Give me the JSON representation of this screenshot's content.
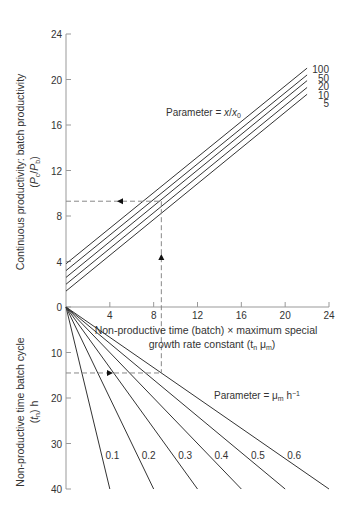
{
  "chart_data": [
    {
      "type": "line",
      "panel": "upper",
      "title": "",
      "xlabel": "Non-productive time (batch) × maximum special growth rate constant (tn μm)",
      "ylabel": "Continuous productivity: batch productivity (Pc/Pb)",
      "xlim": [
        0,
        24
      ],
      "ylim": [
        0,
        24
      ],
      "xticks": [
        4,
        8,
        12,
        16,
        20,
        24
      ],
      "yticks": [
        0,
        4,
        8,
        12,
        16,
        20,
        24
      ],
      "grid": false,
      "annotation": "Parameter = x/x0",
      "x": [
        0,
        22
      ],
      "series": [
        {
          "name": "100",
          "values": [
            3.8,
            21.0
          ]
        },
        {
          "name": "50",
          "values": [
            3.2,
            20.4
          ]
        },
        {
          "name": "20",
          "values": [
            2.6,
            19.9
          ]
        },
        {
          "name": "10",
          "values": [
            2.0,
            19.3
          ]
        },
        {
          "name": "5",
          "values": [
            1.4,
            18.7
          ]
        }
      ]
    },
    {
      "type": "line",
      "panel": "lower",
      "title": "",
      "xlabel": "Non-productive time (batch) × maximum special growth rate constant (tn μm)",
      "ylabel": "Non-productive time batch cycle (tn) h",
      "xlim": [
        0,
        24
      ],
      "ylim": [
        0,
        40
      ],
      "yticks": [
        0,
        10,
        20,
        30,
        40
      ],
      "y_inverted": true,
      "grid": false,
      "annotation": "Parameter = μm h⁻¹",
      "series": [
        {
          "name": "0.1",
          "x": [
            0,
            4.0
          ],
          "values": [
            0,
            40
          ]
        },
        {
          "name": "0.2",
          "x": [
            0,
            8.0
          ],
          "values": [
            0,
            40
          ]
        },
        {
          "name": "0.3",
          "x": [
            0,
            12.0
          ],
          "values": [
            0,
            40
          ]
        },
        {
          "name": "0.4",
          "x": [
            0,
            16.0
          ],
          "values": [
            0,
            40
          ]
        },
        {
          "name": "0.5",
          "x": [
            0,
            20.0
          ],
          "values": [
            0,
            40
          ]
        },
        {
          "name": "0.6",
          "x": [
            0,
            24.0
          ],
          "values": [
            0,
            40
          ]
        }
      ]
    }
  ],
  "guide": {
    "x_value": 8.7,
    "upper_y_value": 9.3,
    "lower_t_value": 14.5
  },
  "labels": {
    "upper_ylabel_line1": "Continuous productivity: batch productivity",
    "upper_ylabel_line2": "(Pc/Pb)",
    "lower_ylabel_line1": "Non-productive time batch cycle",
    "lower_ylabel_line2": "(tn) h",
    "xlabel_line1": "Non-productive time (batch) × maximum special",
    "xlabel_line2": "growth rate constant (tn μm)",
    "upper_param": "Parameter = x/x0",
    "lower_param": "Parameter = μm h⁻¹"
  },
  "colors": {
    "axis": "#999999",
    "line": "#333333",
    "dash": "#888888",
    "text": "#333333"
  }
}
